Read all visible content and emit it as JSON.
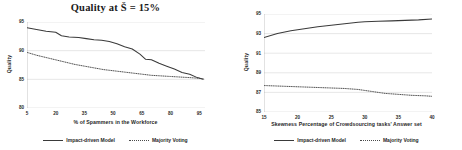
{
  "chart_data": [
    {
      "panel": "left",
      "type": "line",
      "title": "Quality  at  Š = 15%",
      "xlabel": "% of Spammers in the Workforce",
      "ylabel": "Quality",
      "xlim": [
        5,
        98
      ],
      "ylim": [
        80,
        95
      ],
      "xticks": [
        5,
        20,
        35,
        50,
        65,
        80,
        95
      ],
      "yticks": [
        80,
        85,
        90,
        95
      ],
      "grid": "horizontal",
      "legend_position": "bottom-center",
      "series": [
        {
          "name": "Impact-driven Model",
          "style": "solid",
          "color": "#3a3a3a",
          "x": [
            5,
            10,
            15,
            20,
            23,
            27,
            32,
            36,
            40,
            44,
            48,
            52,
            56,
            60,
            64,
            67,
            70,
            74,
            78,
            82,
            86,
            90,
            94,
            97
          ],
          "y": [
            94.0,
            93.7,
            93.4,
            93.2,
            92.6,
            92.4,
            92.3,
            92.1,
            91.9,
            91.8,
            91.6,
            91.2,
            90.7,
            90.3,
            89.4,
            88.5,
            88.4,
            87.8,
            87.3,
            86.8,
            86.2,
            85.9,
            85.3,
            85.0
          ]
        },
        {
          "name": "Majority Voting",
          "style": "dotted",
          "color": "#4a4a4a",
          "x": [
            5,
            10,
            15,
            20,
            25,
            30,
            35,
            40,
            45,
            50,
            55,
            60,
            65,
            70,
            75,
            80,
            85,
            90,
            94,
            97
          ],
          "y": [
            89.7,
            89.2,
            88.8,
            88.4,
            88.0,
            87.6,
            87.3,
            87.0,
            86.7,
            86.5,
            86.3,
            86.1,
            85.9,
            85.7,
            85.6,
            85.5,
            85.4,
            85.3,
            85.2,
            85.1
          ]
        }
      ]
    },
    {
      "panel": "right",
      "type": "line",
      "title": "",
      "xlabel": "Skewness Percentage  of  Crowdsourcing tasks' Answer set",
      "ylabel": "Quality",
      "xlim": [
        15,
        40
      ],
      "ylim": [
        85,
        95
      ],
      "xticks": [
        15,
        20,
        25,
        30,
        35,
        40
      ],
      "yticks": [
        85,
        87,
        89,
        91,
        93,
        95
      ],
      "grid": "horizontal",
      "legend_position": "bottom-center",
      "series": [
        {
          "name": "Impact-driven Model",
          "style": "solid",
          "color": "#3a3a3a",
          "x": [
            15,
            17,
            19,
            21,
            23,
            25,
            27,
            29,
            30,
            32,
            34,
            36,
            38,
            40
          ],
          "y": [
            92.6,
            93.0,
            93.3,
            93.5,
            93.7,
            93.85,
            94.0,
            94.15,
            94.2,
            94.25,
            94.3,
            94.35,
            94.4,
            94.5
          ]
        },
        {
          "name": "Majority Voting",
          "style": "dotted",
          "color": "#4a4a4a",
          "x": [
            15,
            17,
            19,
            21,
            23,
            25,
            27,
            29,
            31,
            33,
            35,
            37,
            39,
            40
          ],
          "y": [
            87.7,
            87.65,
            87.6,
            87.55,
            87.5,
            87.45,
            87.4,
            87.3,
            87.1,
            86.9,
            86.8,
            86.7,
            86.65,
            86.6
          ]
        }
      ]
    }
  ],
  "left": {
    "title": "Quality  at  Š = 15%",
    "ylabel": "Quality",
    "xlabel": "% of Spammers in the Workforce",
    "yticks": [
      "95",
      "90",
      "85",
      "80"
    ],
    "xticks": [
      "5",
      "20",
      "35",
      "50",
      "65",
      "80",
      "95"
    ],
    "legend": [
      {
        "label": "Impact-driven Model",
        "style": "solid"
      },
      {
        "label": "Majority Voting",
        "style": "dotted"
      }
    ]
  },
  "right": {
    "title": "",
    "ylabel": "Quality",
    "xlabel": "Skewness Percentage  of  Crowdsourcing tasks' Answer set",
    "yticks": [
      "95",
      "93",
      "91",
      "89",
      "87",
      "85"
    ],
    "xticks": [
      "15",
      "20",
      "25",
      "30",
      "35",
      "40"
    ],
    "legend": [
      {
        "label": "Impact-driven Model",
        "style": "solid"
      },
      {
        "label": "Majority Voting",
        "style": "dotted"
      }
    ]
  }
}
